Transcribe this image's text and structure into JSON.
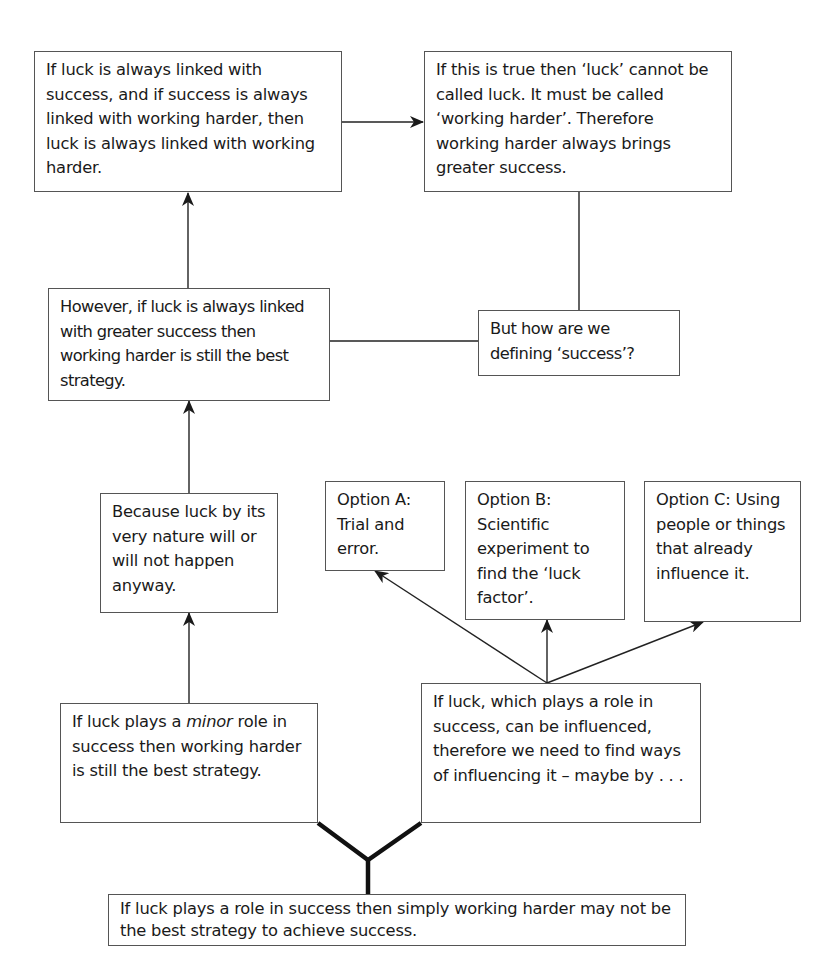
{
  "nodes": {
    "box_linked": "If luck is always linked with success, and if success is always linked with working harder, then luck is always linked with working harder.",
    "box_called": "If this is true then ‘luck’ cannot be called luck. It must be called ‘working harder’. Therefore working harder always brings greater success.",
    "box_however": "However, if luck is always linked with greater success then working harder is still the best strategy.",
    "box_defining": "But how are we defining ‘success’?",
    "box_because": "Because luck by its very nature will or will not happen anyway.",
    "option_a": "Option A: Trial and error.",
    "option_b": "Option B: Scientific experiment to find the ‘luck factor’.",
    "option_c": "Option C: Using people or things that already influence it.",
    "box_minor_pre": "If luck plays a ",
    "box_minor_em": "minor",
    "box_minor_post": " role in success then working harder is still the best strategy.",
    "box_influenced": "If luck, which plays a role in success, can be influenced, therefore we need to find ways of influencing it – maybe by . . .",
    "box_root": "If luck plays a role in success then simply working harder may not be the best strategy to achieve success."
  },
  "edges": [
    {
      "from": "box_root",
      "to": "box_minor",
      "style": "thick"
    },
    {
      "from": "box_root",
      "to": "box_influenced",
      "style": "thick"
    },
    {
      "from": "box_minor",
      "to": "box_because",
      "style": "arrow"
    },
    {
      "from": "box_because",
      "to": "box_however",
      "style": "arrow"
    },
    {
      "from": "box_however",
      "to": "box_linked",
      "style": "arrow"
    },
    {
      "from": "box_linked",
      "to": "box_called",
      "style": "arrow"
    },
    {
      "from": "box_called",
      "to": "box_defining",
      "style": "line"
    },
    {
      "from": "box_defining",
      "to": "box_however",
      "style": "line"
    },
    {
      "from": "box_influenced",
      "to": "option_a",
      "style": "arrow"
    },
    {
      "from": "box_influenced",
      "to": "option_b",
      "style": "arrow"
    },
    {
      "from": "box_influenced",
      "to": "option_c",
      "style": "arrow"
    }
  ],
  "colors": {
    "line": "#222222",
    "border": "#555555",
    "background": "#ffffff"
  }
}
